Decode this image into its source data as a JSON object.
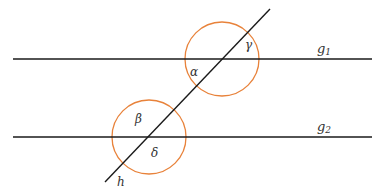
{
  "diagram": {
    "title": "",
    "lines": [
      {
        "id": "g1",
        "label": "g",
        "subscript": "1",
        "type": "parallel-line"
      },
      {
        "id": "g2",
        "label": "g",
        "subscript": "2",
        "type": "parallel-line"
      },
      {
        "id": "h",
        "label": "h",
        "type": "transversal"
      }
    ],
    "angles": [
      {
        "id": "alpha",
        "symbol": "α",
        "intersection": "g1-h"
      },
      {
        "id": "gamma",
        "symbol": "γ",
        "intersection": "g1-h"
      },
      {
        "id": "beta",
        "symbol": "β",
        "intersection": "g2-h"
      },
      {
        "id": "delta",
        "symbol": "δ",
        "intersection": "g2-h"
      }
    ],
    "colors": {
      "line": "#1a1a1a",
      "circle": "#e8823a",
      "text": "#333333"
    }
  }
}
